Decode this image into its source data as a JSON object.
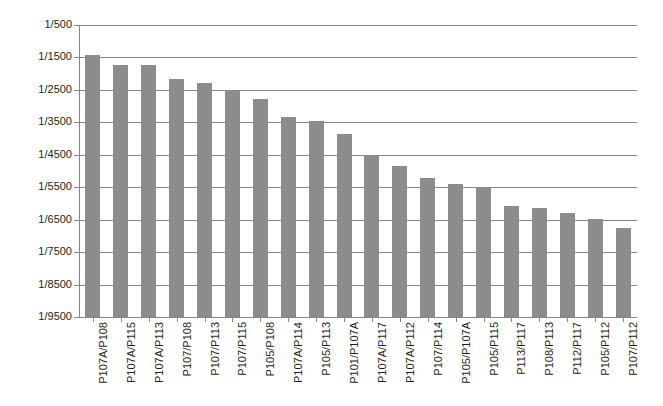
{
  "chart_data": {
    "type": "bar",
    "title": "",
    "subtitle": "",
    "xlabel": "",
    "ylabel": "",
    "legend": [],
    "grid": true,
    "legend_position": "none",
    "orientation": "vertical",
    "bar_color": "#8c8c8c",
    "axis_color": "#868686",
    "grid_color": "#868686",
    "text_color": "#231f20",
    "y_tick_labels": [
      "1/500",
      "1/1500",
      "1/2500",
      "1/3500",
      "1/4500",
      "1/5500",
      "1/6500",
      "1/7500",
      "1/8500",
      "1/9500"
    ],
    "y_tick_denominators": [
      500,
      1500,
      2500,
      3500,
      4500,
      5500,
      6500,
      7500,
      8500,
      9500
    ],
    "ylim_denominator": [
      500,
      9500
    ],
    "y_axis_note": "Axis is labelled as reciprocal fractions 1/N with 1/500 at top and 1/9500 at bottom; bars are drawn upward from the 1/9500 baseline.",
    "categories": [
      "P107A/P108",
      "P107A/P115",
      "P107A/P113",
      "P107/P108",
      "P107/P113",
      "P107/P115",
      "P105/P108",
      "P107A/P114",
      "P105/P113",
      "P101/P107A",
      "P107A/P117",
      "P107A/P112",
      "P107/P114",
      "P105/P107A",
      "P105/P115",
      "P113/P117",
      "P108/P113",
      "P112/P117",
      "P105/P112",
      "P107/P112"
    ],
    "values": [
      1440,
      1720,
      1720,
      2150,
      2300,
      2490,
      2790,
      3330,
      3450,
      3850,
      4500,
      4840,
      5220,
      5390,
      5490,
      6070,
      6130,
      6290,
      6470,
      6760
    ],
    "value_unit": "denominator N of ratio 1/N"
  }
}
